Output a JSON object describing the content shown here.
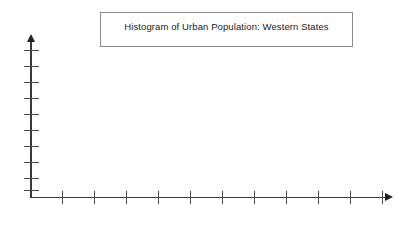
{
  "figure": {
    "background_color": "#ffffff",
    "axis_color": "#3a3a3a",
    "tick_color": "#4a4a4a",
    "title_border_color": "#8c8c8c",
    "title_text_color": "#1a1a1a"
  },
  "title_box": {
    "text": "Histogram of Urban Population: Western States"
  },
  "chart_data": {
    "type": "bar",
    "title": "Histogram of Urban Population: Western States",
    "xlabel": "",
    "ylabel": "",
    "categories": [],
    "values": [],
    "grid": false,
    "legend": false,
    "note": "Blank histogram template: axes drawn with tick marks, no bars plotted",
    "x_axis": {
      "tick_count": 11,
      "tick_labels": [],
      "arrow": true
    },
    "y_axis": {
      "tick_count": 10,
      "tick_labels": [],
      "arrow": true
    }
  },
  "axes": {
    "y_ticks": [
      {
        "index": 1,
        "y": 50
      },
      {
        "index": 2,
        "y": 66
      },
      {
        "index": 3,
        "y": 82
      },
      {
        "index": 4,
        "y": 98
      },
      {
        "index": 5,
        "y": 114
      },
      {
        "index": 6,
        "y": 130
      },
      {
        "index": 7,
        "y": 146
      },
      {
        "index": 8,
        "y": 162
      },
      {
        "index": 9,
        "y": 178
      },
      {
        "index": 10,
        "y": 190
      }
    ],
    "x_ticks": [
      {
        "index": 1,
        "x": 62
      },
      {
        "index": 2,
        "x": 94
      },
      {
        "index": 3,
        "x": 126
      },
      {
        "index": 4,
        "x": 158
      },
      {
        "index": 5,
        "x": 190
      },
      {
        "index": 6,
        "x": 222
      },
      {
        "index": 7,
        "x": 254
      },
      {
        "index": 8,
        "x": 286
      },
      {
        "index": 9,
        "x": 318
      },
      {
        "index": 10,
        "x": 350
      },
      {
        "index": 11,
        "x": 382
      }
    ]
  }
}
